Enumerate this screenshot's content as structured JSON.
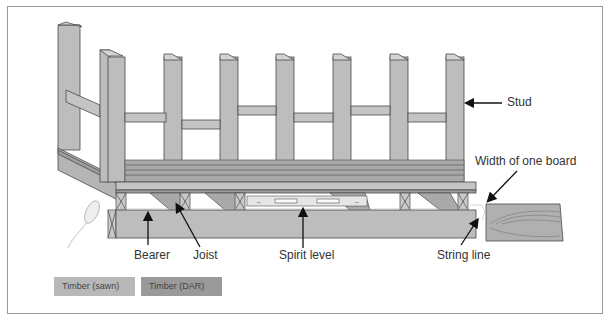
{
  "diagram": {
    "labels": {
      "stud": "Stud",
      "width_of_one_board": "Width of one board",
      "bearer": "Bearer",
      "joist": "Joist",
      "spirit_level": "Spirit level",
      "string_line": "String line"
    },
    "legend": [
      {
        "label": "Timber (sawn)",
        "color": "#b8b8b8"
      },
      {
        "label": "Timber (DAR)",
        "color": "#9a9a9a"
      }
    ],
    "colors": {
      "timber_face": "#bdbdbd",
      "timber_dark": "#9e9e9e",
      "outline": "#4a4a4a",
      "border": "#9a9a9a"
    }
  }
}
